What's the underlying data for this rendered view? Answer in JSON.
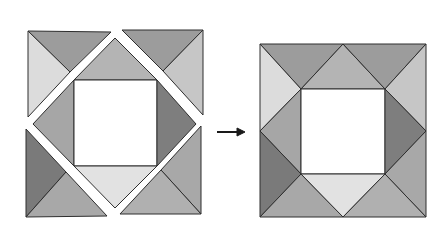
{
  "diagram": {
    "colors": {
      "background": "#ffffff",
      "outline": "#2e2e2e",
      "center": "#ffffff",
      "dark": "#7c7c7c",
      "medium": "#9c9c9c",
      "medium_light": "#aeaeae",
      "light": "#c8c8c8",
      "very_light": "#dedede",
      "arrow": "#1a1a1a"
    },
    "before": {
      "label": "exploded",
      "pieces": [
        {
          "name": "tl-top",
          "points": "28,31 111,32 70,72",
          "fill": "#9c9c9c"
        },
        {
          "name": "tl-left",
          "points": "28,31 70,72 28,117",
          "fill": "#dcdcdc"
        },
        {
          "name": "tr-top",
          "points": "122,30 203,30 163,71",
          "fill": "#9c9c9c"
        },
        {
          "name": "tr-right",
          "points": "203,30 203,115 163,71",
          "fill": "#c6c6c6"
        },
        {
          "name": "center-top",
          "points": "115,38 157,80 74,80",
          "fill": "#b4b4b4"
        },
        {
          "name": "center-left",
          "points": "33,124 74,80 74,166",
          "fill": "#a6a6a6"
        },
        {
          "name": "center-square",
          "points": "74,80 157,80 157,166 74,166",
          "fill": "#ffffff"
        },
        {
          "name": "center-right",
          "points": "157,80 196,124 157,166",
          "fill": "#7e7e7e"
        },
        {
          "name": "center-bottom",
          "points": "74,166 157,166 115,208",
          "fill": "#e2e2e2"
        },
        {
          "name": "bl-left",
          "points": "26,129 66,172 26,217",
          "fill": "#7a7a7a"
        },
        {
          "name": "bl-bottom",
          "points": "26,217 66,172 107,216",
          "fill": "#a8a8a8"
        },
        {
          "name": "br-right",
          "points": "201,126 201,214 161,170",
          "fill": "#a8a8a8"
        },
        {
          "name": "br-bottom",
          "points": "120,214 161,170 201,214",
          "fill": "#b0b0b0"
        }
      ]
    },
    "arrow": {
      "x1": 217,
      "y1": 132,
      "x2": 245,
      "y2": 132
    },
    "after": {
      "label": "assembled",
      "pieces": [
        {
          "name": "tl-top",
          "points": "260,44 343,44 301,89",
          "fill": "#9c9c9c"
        },
        {
          "name": "tl-left",
          "points": "260,44 301,89 260,131",
          "fill": "#dcdcdc"
        },
        {
          "name": "top-center",
          "points": "301,89 343,44 385,89",
          "fill": "#b4b4b4"
        },
        {
          "name": "tr-top",
          "points": "343,44 426,44 385,89",
          "fill": "#9c9c9c"
        },
        {
          "name": "tr-right",
          "points": "426,44 426,131 385,89",
          "fill": "#c6c6c6"
        },
        {
          "name": "left-center",
          "points": "260,131 301,89 301,174",
          "fill": "#a6a6a6"
        },
        {
          "name": "center-square",
          "points": "301,89 385,89 385,174 301,174",
          "fill": "#ffffff"
        },
        {
          "name": "right-center",
          "points": "385,89 426,131 385,174",
          "fill": "#7e7e7e"
        },
        {
          "name": "bl-left",
          "points": "260,131 301,174 260,217",
          "fill": "#7a7a7a"
        },
        {
          "name": "bl-bottom",
          "points": "260,217 301,174 343,217",
          "fill": "#a8a8a8"
        },
        {
          "name": "bottom-center",
          "points": "301,174 385,174 343,217",
          "fill": "#e2e2e2"
        },
        {
          "name": "br-right",
          "points": "426,131 426,217 385,174",
          "fill": "#a8a8a8"
        },
        {
          "name": "br-bottom",
          "points": "385,174 426,217 343,217",
          "fill": "#b0b0b0"
        }
      ]
    }
  }
}
